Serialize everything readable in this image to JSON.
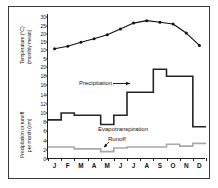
{
  "chart_data": {
    "type": "line",
    "title": "",
    "categories": [
      "J",
      "F",
      "M",
      "A",
      "M",
      "J",
      "J",
      "A",
      "S",
      "O",
      "N",
      "D"
    ],
    "month_labels": [
      "J",
      "F",
      "M",
      "A",
      "M",
      "J",
      "J",
      "A",
      "S",
      "O",
      "N",
      "D"
    ],
    "panels": [
      {
        "name": "temperature",
        "ylabel": "Temperature (°C)\n(monthly mean)",
        "ylabel_line1": "Temperature (°C)",
        "ylabel_line2": "(monthly mean)",
        "ylim": [
          0,
          32
        ],
        "yticks": [
          5,
          10,
          15,
          20,
          25,
          30
        ],
        "series": [
          {
            "name": "Temperature",
            "style": "line-markers",
            "color": "#111111",
            "values": [
              11,
              12.5,
              15,
              17,
              19.5,
              23,
              26.5,
              28,
              27,
              26,
              20.5,
              13
            ]
          }
        ]
      },
      {
        "name": "water-balance",
        "ylabel_line1": "Precipitation or runoff",
        "ylabel_line2": "per month (cm)",
        "ylim": [
          0,
          20
        ],
        "yticks": [
          0,
          2,
          4,
          6,
          8,
          10,
          12,
          14,
          16,
          18,
          20
        ],
        "series": [
          {
            "name": "Precipitation",
            "style": "step",
            "color": "#262626",
            "values": [
              8.5,
              10,
              9.5,
              9.5,
              7.5,
              9.5,
              14.5,
              14.5,
              19.5,
              18,
              18,
              7
            ]
          },
          {
            "name": "Evapotranspiration",
            "style": "step",
            "color": "#262626",
            "values": [
              8.5,
              10,
              9.5,
              9.5,
              7.5,
              9.5,
              14.5,
              14.5,
              19.5,
              18,
              18,
              7
            ],
            "tail_values": [
              7,
              5.8,
              5.8,
              7
            ]
          },
          {
            "name": "Runoff",
            "style": "step",
            "color": "#a8a8a8",
            "values": [
              2.6,
              2.6,
              2.2,
              2.2,
              1.6,
              2.4,
              2.6,
              2.6,
              2.6,
              3.2,
              2.8,
              3.4
            ]
          }
        ]
      }
    ],
    "annotations": [
      {
        "name": "precipitation-label",
        "text": "Precipitation",
        "arrow": "right"
      },
      {
        "name": "evapotranspiration-label",
        "text": "Evapotranspiration",
        "arrow": "none"
      },
      {
        "name": "runoff-label",
        "text": "Runoff",
        "arrow": "down-left"
      }
    ],
    "grid": false,
    "legend_position": "inline-annotations"
  },
  "axis": {
    "temp_ticks": [
      "30",
      "25",
      "20",
      "15",
      "10",
      "5"
    ],
    "precip_ticks": [
      "20",
      "18",
      "16",
      "14",
      "12",
      "10",
      "8",
      "6",
      "4",
      "2",
      "0"
    ]
  },
  "labels": {
    "temp_title_line1": "Temperature (°C)",
    "temp_title_line2": "(monthly mean)",
    "precip_title_line1": "Precipitation or runoff",
    "precip_title_line2": "per month (cm)",
    "precipitation": "Precipitation",
    "evapotranspiration": "Evapotranspiration",
    "runoff": "Runoff"
  },
  "colors": {
    "line": "#111111",
    "precip": "#262626",
    "runoff": "#a8a8a8",
    "frame": "#3a3a3a",
    "background": "#ffffff"
  }
}
